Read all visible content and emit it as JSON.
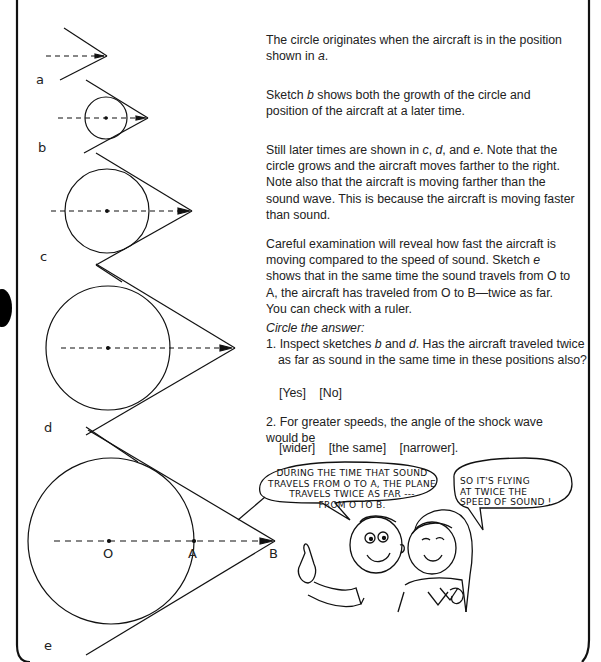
{
  "page": {
    "top_cut_text": "",
    "paragraphs": [
      "The circle originates when the aircraft is in the position shown in a.",
      "Sketch b shows both the growth of the circle and position of the aircraft at a later time.",
      "Still later times are shown in c, d, and e. Note that the circle grows and the aircraft moves farther to the right. Note also that the aircraft is moving farther than the sound wave. This is because the aircraft is moving faster than sound.",
      "Careful examination will reveal how fast the aircraft is moving compared to the speed of sound. Sketch e shows that in the same time the sound travels from O to A, the aircraft has traveled from O to B—twice as far. You can check with a ruler."
    ],
    "p1": {
      "a": "The circle originates when the aircraft is in the position shown in ",
      "b": "a",
      "c": "."
    },
    "p2": {
      "a": "Sketch ",
      "b": "b",
      "c": " shows both the growth of the circle and position of the aircraft at a later time."
    },
    "p3": {
      "a": "Still later times are shown in ",
      "b": "c",
      "c": ", ",
      "d": "d",
      "e": ", and ",
      "f": "e",
      "g": ". Note that the circle grows and the aircraft moves farther to the right. Note also that the aircraft is moving farther than the sound wave. This is because the aircraft is moving faster than sound."
    },
    "p4": {
      "a": "Careful examination will reveal how fast the aircraft is moving compared to the speed of sound. Sketch ",
      "b": "e",
      "c": " shows that in the same time the sound travels from O to A, the aircraft has traveled from O to B—twice as far. You can check with a ruler."
    },
    "instruction": "Circle the answer:",
    "questions": [
      {
        "number": "1.",
        "text_a": "Inspect sketches ",
        "text_b": "b",
        "text_c": " and ",
        "text_d": "d",
        "text_e": ". Has the aircraft traveled twice as far as sound in the same time in these positions also?",
        "options": [
          "[Yes]",
          "[No]"
        ]
      },
      {
        "number": "2.",
        "text": "For greater speeds, the angle of the shock wave would be",
        "options": [
          "[wider]",
          "[the same]",
          "[narrower]."
        ]
      }
    ],
    "sketch_labels": [
      "a",
      "b",
      "c",
      "d",
      "e"
    ],
    "point_labels": {
      "O": "O",
      "A": "A",
      "B": "B"
    },
    "bubbles": {
      "boy": [
        "DURING THE TIME THAT SOUND",
        "TRAVELS FROM O TO A, THE PLANE",
        "TRAVELS TWICE AS FAR ---",
        "FROM O TO B."
      ],
      "girl": [
        "SO IT'S FLYING",
        "AT TWICE THE",
        "SPEED OF SOUND !"
      ]
    }
  }
}
